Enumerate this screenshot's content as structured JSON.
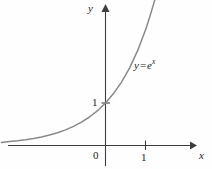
{
  "figure": {
    "background_color": "#fefefe",
    "axis_color": "#3d3d3d",
    "curve_color": "#8a8a8a",
    "text_color": "#1c1c1c"
  },
  "labels": {
    "y_axis": "y",
    "x_axis": "x",
    "origin": "0",
    "y_tick_1": "1",
    "x_tick_1": "1"
  },
  "equation": {
    "lhs": "y",
    "operator": "=",
    "base": "e",
    "exponent": "x",
    "full": "y = e^x"
  },
  "chart_data": {
    "type": "line",
    "title": "",
    "xlabel": "x",
    "ylabel": "y",
    "legend": [
      "y = e^x"
    ],
    "legend_position": "inline-right-of-curve",
    "grid": false,
    "xlim": [
      -2.6,
      2.2
    ],
    "ylim": [
      -0.55,
      3.5
    ],
    "xticks": [
      0,
      1
    ],
    "xtick_labels": [
      "0",
      "1"
    ],
    "yticks": [
      1
    ],
    "ytick_labels": [
      "1"
    ],
    "series": [
      {
        "name": "y = e^x",
        "function": "y = e^x",
        "color": "#8a8a8a",
        "x": [
          -2.6,
          -2.4,
          -2.2,
          -2.0,
          -1.8,
          -1.6,
          -1.4,
          -1.2,
          -1.0,
          -0.8,
          -0.6,
          -0.4,
          -0.2,
          0.0,
          0.2,
          0.4,
          0.6,
          0.8,
          1.0,
          1.1,
          1.2,
          1.25
        ],
        "y": [
          0.074,
          0.091,
          0.111,
          0.135,
          0.165,
          0.202,
          0.247,
          0.301,
          0.368,
          0.449,
          0.549,
          0.67,
          0.819,
          1.0,
          1.221,
          1.492,
          1.822,
          2.226,
          2.718,
          3.004,
          3.32,
          3.49
        ]
      }
    ],
    "annotations": [
      {
        "text": "y = e^x",
        "x": 0.73,
        "y": 2.05
      },
      {
        "text": "1",
        "x": -0.33,
        "y": 1.02
      },
      {
        "text": "0",
        "x": -0.28,
        "y": -0.2
      },
      {
        "text": "1",
        "x": 0.9,
        "y": -0.22
      }
    ]
  }
}
